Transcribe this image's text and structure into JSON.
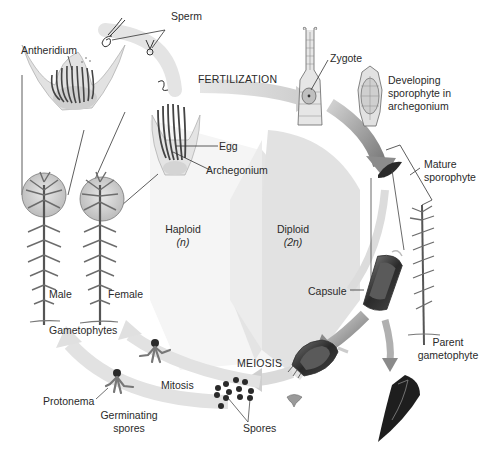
{
  "diagram": {
    "regions": {
      "haploid": {
        "label": "Haploid",
        "ploidy": "(n)"
      },
      "diploid": {
        "label": "Diploid",
        "ploidy": "(2n)"
      }
    },
    "processes": {
      "fertilization": "FERTILIZATION",
      "meiosis": "MEIOSIS",
      "mitosis": "Mitosis"
    },
    "labels": {
      "sperm": "Sperm",
      "antheridium": "Antheridium",
      "egg": "Egg",
      "archegonium": "Archegonium",
      "zygote": "Zygote",
      "developing_sporophyte": [
        "Developing",
        "sporophyte in",
        "archegonium"
      ],
      "mature_sporophyte": [
        "Mature",
        "sporophyte"
      ],
      "male": "Male",
      "female": "Female",
      "gametophytes": "Gametophytes",
      "capsule": "Capsule",
      "parent_gametophyte": [
        "Parent",
        "gametophyte"
      ],
      "protonema": "Protonema",
      "germinating_spores": [
        "Germinating",
        "spores"
      ],
      "spores": "Spores"
    },
    "colors": {
      "haploid_bg": "#f4f4f4",
      "diploid_bg": "#e2e2e2",
      "arrow_light": "#d6d6d6",
      "arrow_dark": "#8a8a8a",
      "plant": "#6a6a6a",
      "capsule_dark": "#2e2e2e",
      "spore": "#2a2a2a"
    }
  }
}
